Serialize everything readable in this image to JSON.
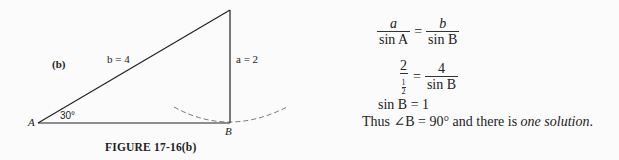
{
  "figure": {
    "panel_label": "(b)",
    "side_b_label": "b = 4",
    "side_a_label": "a = 2",
    "angle_label": "30°",
    "vertex_A": "A",
    "vertex_B": "B",
    "caption": "FIGURE 17-16(b)"
  },
  "solution": {
    "eq1": {
      "lhs_num": "a",
      "lhs_den": "sin A",
      "op": "=",
      "rhs_num": "b",
      "rhs_den": "sin B"
    },
    "eq2": {
      "lhs_num": "2",
      "lhs_den_num": "1",
      "lhs_den_den": "2",
      "op": "=",
      "rhs_num": "4",
      "rhs_den": "sin B"
    },
    "eq3": "sin B = 1",
    "conclusion_prefix": "Thus ∠B = 90° and there is ",
    "conclusion_italic": "one solution",
    "conclusion_suffix": "."
  }
}
